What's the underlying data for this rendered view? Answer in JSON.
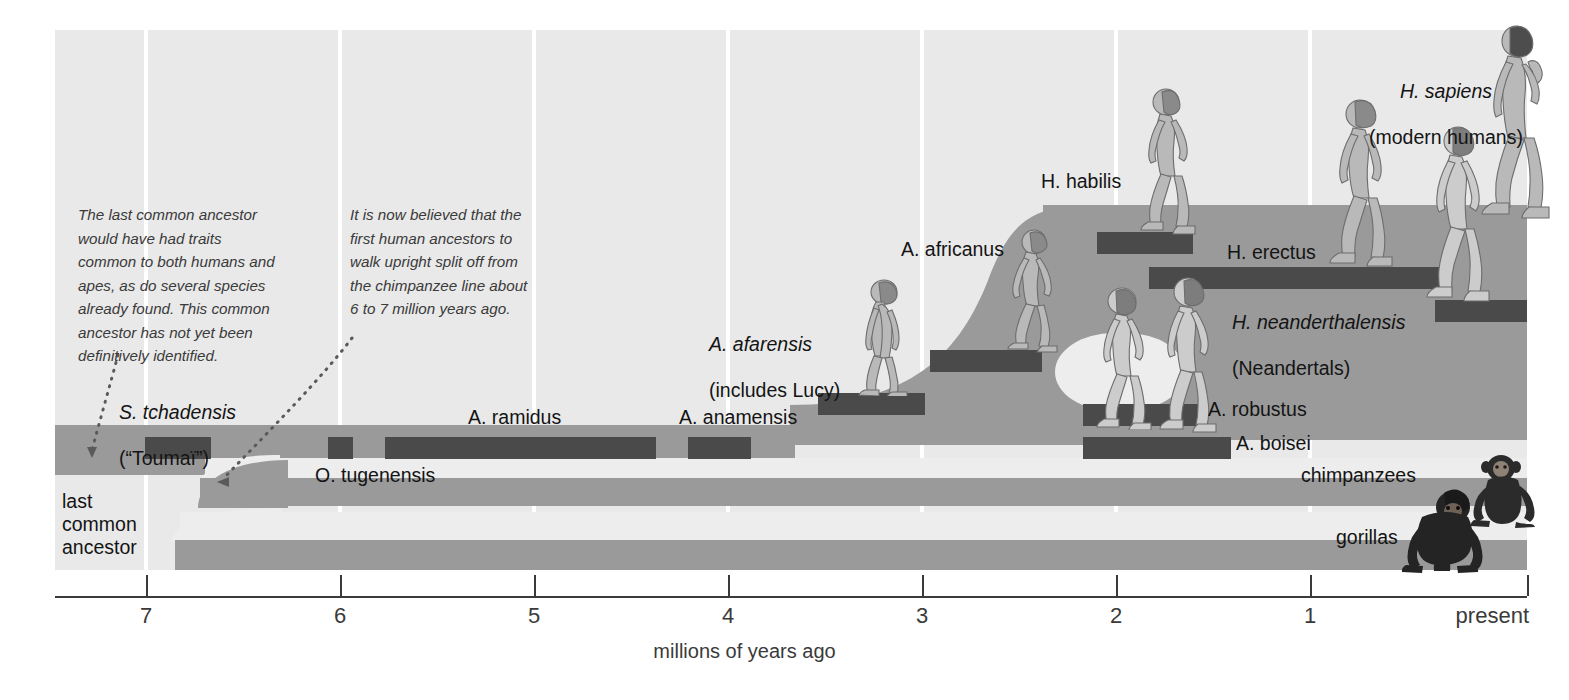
{
  "chart_data": {
    "type": "timeline",
    "xlabel": "millions of years ago",
    "ylabel": "",
    "xlim": [
      7.6,
      0
    ],
    "grid": true,
    "legend_position": "none",
    "tick_labels": [
      "7",
      "6",
      "5",
      "4",
      "3",
      "2",
      "1",
      "present"
    ],
    "tick_values": [
      7,
      6,
      5,
      4,
      3,
      2,
      1,
      0
    ],
    "lineages": [
      {
        "name": "hominins",
        "label": "last common ancestor",
        "start_mya": 7.6,
        "end_mya": 0
      },
      {
        "name": "chimpanzees",
        "label": "chimpanzees",
        "start_mya": 6.85,
        "end_mya": 0
      },
      {
        "name": "gorillas",
        "label": "gorillas",
        "start_mya": 6.95,
        "end_mya": 0
      }
    ],
    "species": [
      {
        "name": "S. tchadensis",
        "start_mya": 7.15,
        "end_mya": 6.82,
        "bar": {
          "x": 145,
          "y": 437,
          "w": 66
        }
      },
      {
        "name": "O. tugenensis",
        "start_mya": 6.2,
        "end_mya": 6.06,
        "bar": {
          "x": 328,
          "y": 437,
          "w": 25
        }
      },
      {
        "name": "A. ramidus",
        "start_mya": 5.92,
        "end_mya": 4.47,
        "bar": {
          "x": 385,
          "y": 437,
          "w": 271
        }
      },
      {
        "name": "A. anamensis",
        "start_mya": 4.3,
        "end_mya": 3.96,
        "bar": {
          "x": 688,
          "y": 437,
          "w": 63
        }
      },
      {
        "name": "A. afarensis",
        "start_mya": 3.93,
        "end_mya": 3.4,
        "bar": {
          "x": 818,
          "y": 393,
          "w": 107
        }
      },
      {
        "name": "A. africanus",
        "start_mya": 3.32,
        "end_mya": 2.76,
        "bar": {
          "x": 930,
          "y": 350,
          "w": 112
        }
      },
      {
        "name": "H. habilis",
        "start_mya": 2.35,
        "end_mya": 1.9,
        "bar": {
          "x": 1097,
          "y": 232,
          "w": 96
        }
      },
      {
        "name": "H. erectus",
        "start_mya": 2.05,
        "end_mya": 0.55,
        "bar": {
          "x": 1149,
          "y": 267,
          "w": 300
        }
      },
      {
        "name": "H. neanderthalensis",
        "start_mya": 0.46,
        "end_mya": 0.16,
        "bar": {
          "x": 1435,
          "y": 300,
          "w": 92
        }
      },
      {
        "name": "A. robustus",
        "start_mya": 2.0,
        "end_mya": 1.42,
        "bar": {
          "x": 1083,
          "y": 404,
          "w": 120
        }
      },
      {
        "name": "A. boisei",
        "start_mya": 2.1,
        "end_mya": 1.35,
        "bar": {
          "x": 1083,
          "y": 437,
          "w": 148
        }
      }
    ]
  },
  "axis": {
    "ticks": [
      {
        "label": "7",
        "x": 146
      },
      {
        "label": "6",
        "x": 340
      },
      {
        "label": "5",
        "x": 534
      },
      {
        "label": "4",
        "x": 728
      },
      {
        "label": "3",
        "x": 922
      },
      {
        "label": "2",
        "x": 1116
      },
      {
        "label": "1",
        "x": 1310
      },
      {
        "label": "present",
        "x": 1527
      }
    ],
    "title": "millions of years ago"
  },
  "notes": [
    {
      "id": "note-last-common-ancestor",
      "text": "The last common ancestor\nwould have had traits\ncommon to both humans and\napes, as do several species\nalready found. This common\nancestor has not yet been\ndefinitively identified."
    },
    {
      "id": "note-upright-split",
      "text": "It is now believed that the\nfirst human ancestors to\nwalk upright split off from\nthe chimpanzee line about\n6 to 7 million years ago."
    }
  ],
  "labels": {
    "last_common_ancestor": "last\ncommon\nancestor",
    "s_tchadensis": "S. tchadensis",
    "s_tchadensis_common": "(“Toumaï”)",
    "o_tugenensis": "O. tugenensis",
    "a_ramidus": "A. ramidus",
    "a_anamensis": "A. anamensis",
    "a_afarensis": "A. afarensis",
    "a_afarensis_common": "(includes Lucy)",
    "a_africanus": "A. africanus",
    "h_habilis": "H. habilis",
    "h_erectus": "H. erectus",
    "h_neanderthalensis": "H. neanderthalensis",
    "h_neanderthalensis_common": "(Neandertals)",
    "h_sapiens": "H. sapiens",
    "h_sapiens_common": "(modern humans)",
    "a_robustus": "A. robustus",
    "a_boisei": "A. boisei",
    "chimpanzees": "chimpanzees",
    "gorillas": "gorillas"
  },
  "colors": {
    "background": "#ffffff",
    "plot_background": "#e9e9e9",
    "gridline": "#ffffff",
    "band": "#9a9a9a",
    "species_bar": "#4a4a4a",
    "text": "#141414",
    "note_text": "#3a3a3a",
    "axis": "#3a3a3a",
    "figure_fill": "#b4b4b4",
    "figure_dark": "#7d7d7d",
    "ape_fill": "#2e2e2e"
  }
}
